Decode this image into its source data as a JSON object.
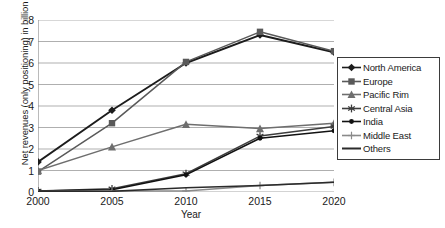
{
  "chart_data": {
    "type": "line",
    "title": "",
    "xlabel": "Year",
    "ylabel": "Net revenues (only positioning) in billion €",
    "categories": [
      "2000",
      "2005",
      "2010",
      "2015",
      "2020"
    ],
    "x": [
      2000,
      2005,
      2010,
      2015,
      2020
    ],
    "xlim": [
      2000,
      2020
    ],
    "ylim": [
      0,
      8
    ],
    "yticks": [
      0,
      1,
      2,
      3,
      4,
      5,
      6,
      7,
      8
    ],
    "xticks": [
      "2000",
      "2005",
      "2010",
      "2015",
      "2020"
    ],
    "grid": "horizontal",
    "legend_position": "right",
    "series": [
      {
        "name": "North America",
        "marker": "diamond",
        "color": "#1c1c1c",
        "values": [
          1.4,
          3.8,
          6.0,
          7.3,
          6.5
        ]
      },
      {
        "name": "Europe",
        "marker": "square",
        "color": "#595959",
        "values": [
          0.95,
          3.2,
          6.05,
          7.45,
          6.55
        ]
      },
      {
        "name": "Pacific Rim",
        "marker": "triangle",
        "color": "#6e6e6e",
        "values": [
          1.0,
          2.1,
          3.15,
          2.95,
          3.2
        ]
      },
      {
        "name": "Central Asia",
        "marker": "asterisk",
        "color": "#3d3d3d",
        "values": [
          0.05,
          0.15,
          0.85,
          2.6,
          3.05
        ]
      },
      {
        "name": "India",
        "marker": "dot",
        "color": "#111111",
        "values": [
          0.05,
          0.1,
          0.8,
          2.5,
          2.85
        ]
      },
      {
        "name": "Middle East",
        "marker": "plus",
        "color": "#8a8a8a",
        "values": [
          0.02,
          0.05,
          0.05,
          0.3,
          0.45
        ]
      },
      {
        "name": "Others",
        "marker": "none",
        "color": "#2b2b2b",
        "values": [
          0.02,
          0.03,
          0.2,
          0.3,
          0.45
        ]
      }
    ]
  },
  "axis_color": "#8c8c8c",
  "grid_color": "#a6a6a6",
  "legend_border_color": "#3b3b3b"
}
